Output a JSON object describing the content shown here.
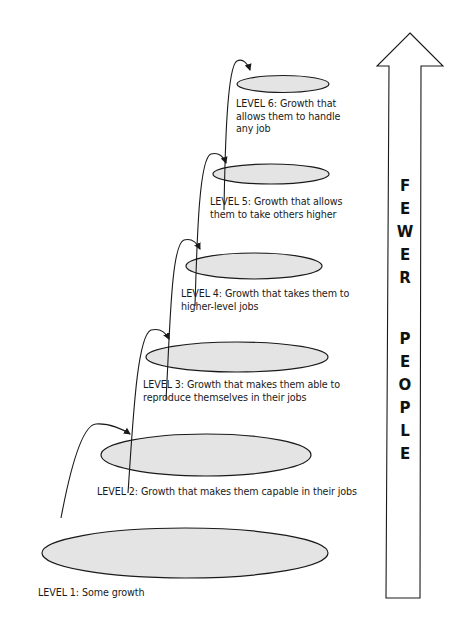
{
  "levels": [
    {
      "id": 1,
      "lines": [
        "LEVEL 1: Some growth"
      ]
    },
    {
      "id": 2,
      "lines": [
        "LEVEL 2: Growth that makes them capable in their jobs"
      ]
    },
    {
      "id": 3,
      "lines": [
        "LEVEL 3: Growth that makes them able to",
        "reproduce themselves in their jobs"
      ]
    },
    {
      "id": 4,
      "lines": [
        "LEVEL 4: Growth that takes them to",
        "higher-level jobs"
      ]
    },
    {
      "id": 5,
      "lines": [
        "LEVEL 5: Growth that allows",
        "them to take others higher"
      ]
    },
    {
      "id": 6,
      "lines": [
        "LEVEL 6: Growth that",
        "allows them to handle",
        "any job"
      ]
    }
  ],
  "arrow": {
    "letters_word1": [
      "F",
      "E",
      "W",
      "E",
      "R"
    ],
    "letters_word2": [
      "P",
      "E",
      "O",
      "P",
      "L",
      "E"
    ],
    "caption": "FEWER PEOPLE",
    "direction": "up"
  },
  "colors": {
    "ellipse_fill": "#e4e4e4",
    "stroke": "#1a1a1a",
    "background": "#ffffff"
  }
}
